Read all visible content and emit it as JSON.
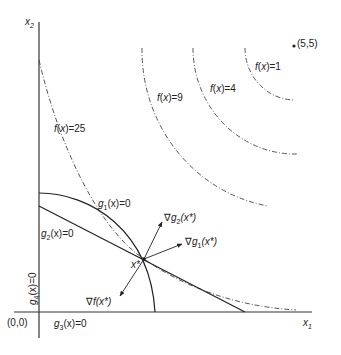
{
  "diagram": {
    "type": "constrained-optimization-kkt",
    "axes": {
      "x_label": "x",
      "x_sub": "1",
      "y_label": "x",
      "y_sub": "2",
      "origin_label": "(0,0)"
    },
    "unconstrained_optimum": {
      "label": "(5,5)"
    },
    "contours": [
      {
        "label_f": "f",
        "label_x": "x",
        "value": "1"
      },
      {
        "label_f": "f",
        "label_x": "x",
        "value": "4"
      },
      {
        "label_f": "f",
        "label_x": "x",
        "value": "9"
      },
      {
        "label_f": "f",
        "label_x": "x",
        "value": "25"
      }
    ],
    "constraints": {
      "g1": {
        "g": "g",
        "sub": "1",
        "rest": "(x)=0"
      },
      "g2": {
        "g": "g",
        "sub": "2",
        "rest": "(x)=0"
      },
      "g3": {
        "g": "g",
        "sub": "3",
        "rest": "(x)=0"
      },
      "g4": {
        "g": "g",
        "sub": "4",
        "rest": "(x)=0"
      }
    },
    "optimum": {
      "label": "x*"
    },
    "gradients": {
      "grad_g2": {
        "nabla": "∇",
        "g": "g",
        "sub": "2",
        "rest": "(x*)"
      },
      "grad_g1": {
        "nabla": "∇",
        "g": "g",
        "sub": "1",
        "rest": "(x*)"
      },
      "grad_f": {
        "nabla": "∇",
        "f": "f",
        "rest": "(x*)"
      }
    }
  }
}
